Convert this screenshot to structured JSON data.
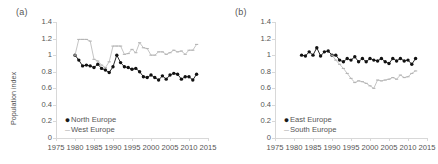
{
  "figure": {
    "panels": [
      {
        "tag": "(a)",
        "ylabel": "Population index",
        "xlabel": "",
        "legend": [
          {
            "label": "North Europe",
            "marker": "filled-circle",
            "color": "#111111"
          },
          {
            "label": "West Europe",
            "marker": "dash",
            "color": "#b5b5b5"
          }
        ]
      },
      {
        "tag": "(b)",
        "ylabel": "",
        "xlabel": "",
        "legend": [
          {
            "label": "East Europe",
            "marker": "filled-circle",
            "color": "#111111"
          },
          {
            "label": "South Europe",
            "marker": "dash",
            "color": "#b5b5b5"
          }
        ]
      }
    ],
    "yticks": [
      "0",
      "0.2",
      "0.4",
      "0.6",
      "0.8",
      "1",
      "1.2",
      "1.4"
    ],
    "xticks": [
      "1975",
      "1980",
      "1985",
      "1990",
      "1995",
      "2000",
      "2005",
      "2010",
      "2015"
    ]
  },
  "chart_data": [
    {
      "type": "line",
      "title": "(a)",
      "xlabel": "",
      "ylabel": "Population index",
      "xlim": [
        1975,
        2015
      ],
      "ylim": [
        0,
        1.4
      ],
      "yticks": [
        0,
        0.2,
        0.4,
        0.6,
        0.8,
        1.0,
        1.2,
        1.4
      ],
      "xticks": [
        1975,
        1980,
        1985,
        1990,
        1995,
        2000,
        2005,
        2010,
        2015
      ],
      "grid": false,
      "legend_position": "lower-left",
      "x": [
        1980,
        1981,
        1982,
        1983,
        1984,
        1985,
        1986,
        1987,
        1988,
        1989,
        1990,
        1991,
        1992,
        1993,
        1994,
        1995,
        1996,
        1997,
        1998,
        1999,
        2000,
        2001,
        2002,
        2003,
        2004,
        2005,
        2006,
        2007,
        2008,
        2009,
        2010,
        2011,
        2012
      ],
      "series": [
        {
          "name": "North Europe",
          "marker": "filled-circle",
          "color": "#111111",
          "values": [
            1.0,
            0.94,
            0.87,
            0.88,
            0.87,
            0.85,
            0.89,
            0.84,
            0.82,
            0.79,
            0.86,
            1.0,
            0.91,
            0.86,
            0.85,
            0.83,
            0.84,
            0.8,
            0.74,
            0.73,
            0.76,
            0.73,
            0.7,
            0.75,
            0.71,
            0.76,
            0.78,
            0.77,
            0.71,
            0.74,
            0.74,
            0.7,
            0.77
          ]
        },
        {
          "name": "West Europe",
          "marker": "dash",
          "color": "#b5b5b5",
          "values": [
            1.0,
            1.19,
            1.19,
            1.19,
            1.17,
            0.95,
            0.93,
            0.88,
            0.85,
            0.92,
            1.11,
            1.11,
            1.11,
            1.01,
            1.02,
            1.07,
            1.03,
            1.15,
            1.09,
            1.08,
            1.0,
            1.0,
            1.04,
            1.04,
            1.01,
            1.03,
            1.06,
            1.04,
            1.05,
            1.01,
            1.06,
            1.06,
            1.13
          ]
        }
      ]
    },
    {
      "type": "line",
      "title": "(b)",
      "xlabel": "",
      "ylabel": "",
      "xlim": [
        1975,
        2015
      ],
      "ylim": [
        0,
        1.4
      ],
      "yticks": [
        0,
        0.2,
        0.4,
        0.6,
        0.8,
        1.0,
        1.2,
        1.4
      ],
      "xticks": [
        1975,
        1980,
        1985,
        1990,
        1995,
        2000,
        2005,
        2010,
        2015
      ],
      "grid": false,
      "legend_position": "lower-left",
      "x": [
        1982,
        1983,
        1984,
        1985,
        1986,
        1987,
        1988,
        1989,
        1990,
        1991,
        1992,
        1993,
        1994,
        1995,
        1996,
        1997,
        1998,
        1999,
        2000,
        2001,
        2002,
        2003,
        2004,
        2005,
        2006,
        2007,
        2008,
        2009,
        2010,
        2011,
        2012
      ],
      "series": [
        {
          "name": "East Europe",
          "marker": "filled-circle",
          "color": "#111111",
          "values": [
            1.0,
            0.99,
            1.04,
            1.0,
            1.09,
            0.99,
            1.04,
            1.05,
            1.0,
            1.0,
            0.94,
            0.92,
            0.96,
            0.94,
            0.98,
            0.92,
            0.96,
            0.92,
            0.96,
            0.94,
            0.93,
            0.96,
            0.92,
            0.9,
            0.96,
            0.93,
            0.96,
            0.93,
            0.94,
            0.89,
            0.96
          ]
        },
        {
          "name": "South Europe",
          "marker": "dash",
          "color": "#b5b5b5",
          "values": [
            null,
            null,
            null,
            null,
            null,
            null,
            null,
            null,
            1.0,
            0.94,
            0.89,
            0.84,
            0.78,
            0.72,
            0.67,
            0.69,
            0.68,
            0.66,
            0.63,
            0.6,
            0.7,
            0.69,
            0.7,
            0.71,
            0.73,
            0.71,
            0.76,
            0.73,
            0.74,
            0.78,
            0.81
          ]
        }
      ]
    }
  ]
}
